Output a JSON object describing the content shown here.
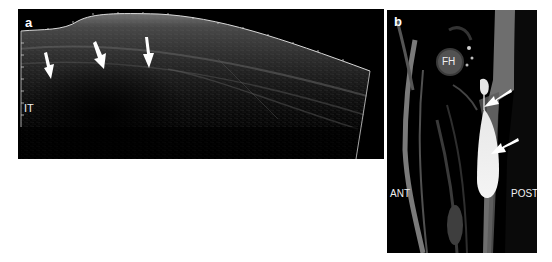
{
  "figure": {
    "panels": [
      {
        "id": "a",
        "letter": "a",
        "modality": "ultrasound",
        "labels": {
          "depth_marker": "IT"
        },
        "arrow_count": 3
      },
      {
        "id": "b",
        "letter": "b",
        "modality": "MRI",
        "labels": {
          "femoral_head": "FH",
          "anterior": "ANT",
          "posterior": "POST"
        },
        "arrow_count": 2
      }
    ],
    "colors": {
      "background": "#ffffff",
      "panel_bg": "#000000",
      "annotation": "#ffffff"
    }
  }
}
